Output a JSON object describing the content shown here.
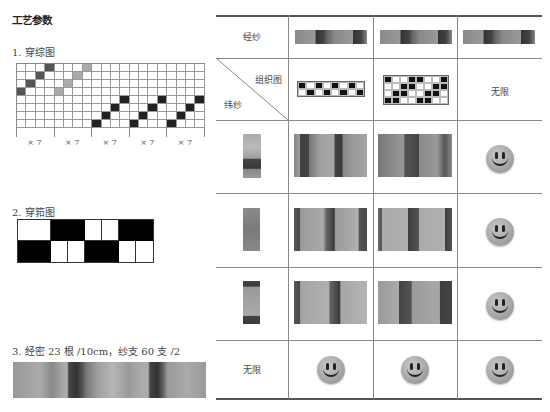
{
  "title": "工艺参数",
  "sections": {
    "threading": {
      "label": "1. 穿综图",
      "repeat_labels": [
        "× 7",
        "× 7",
        "× 7",
        "× 7",
        "× 7"
      ]
    },
    "reeding": {
      "label": "2. 穿筘图"
    },
    "density": {
      "label": "3. 经密 23 根 /10cm，纱支 60 支 /2"
    }
  },
  "table": {
    "warp_label": "经纱",
    "weft_label": "纬纱",
    "weave_label": "组织图",
    "unlimited_label": "无限",
    "weave_columns": [
      {
        "name": "plain-weave",
        "rows": 2,
        "cols": 8
      },
      {
        "name": "twill-weave",
        "rows": 4,
        "cols": 8
      },
      {
        "name": "unlimited",
        "text": "无限"
      }
    ],
    "weft_rows": [
      {
        "name": "weft-1",
        "results": [
          "fabric",
          "fabric",
          "smiley"
        ]
      },
      {
        "name": "weft-2",
        "results": [
          "fabric",
          "fabric",
          "smiley"
        ]
      },
      {
        "name": "weft-3",
        "results": [
          "fabric",
          "fabric",
          "smiley"
        ]
      },
      {
        "name": "weft-unlimited",
        "label": "无限",
        "results": [
          "smiley",
          "smiley",
          "smiley"
        ]
      }
    ]
  }
}
